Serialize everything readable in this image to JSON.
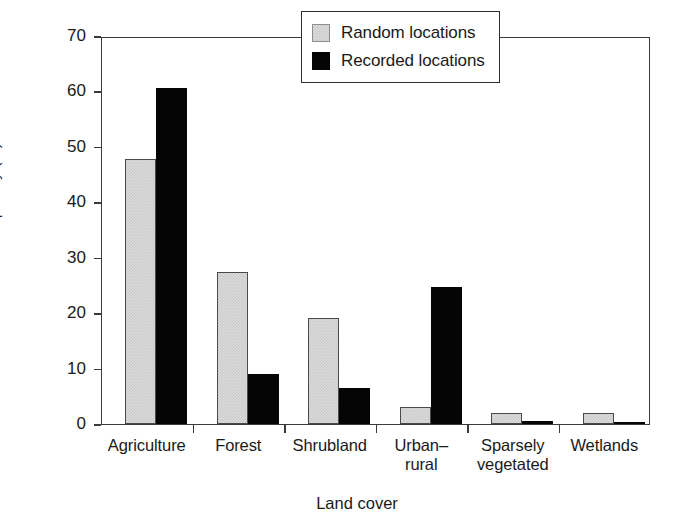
{
  "chart_data": {
    "type": "bar",
    "title": "",
    "xlabel": "Land cover",
    "ylabel": "Frequency (%)",
    "ylim": [
      0,
      70
    ],
    "yticks": [
      0,
      10,
      20,
      30,
      40,
      50,
      60,
      70
    ],
    "ytick_labels": [
      "0",
      "10",
      "20",
      "30",
      "40",
      "50",
      "60",
      "70"
    ],
    "grid": false,
    "legend_position": "top-right",
    "categories": [
      "Agriculture",
      "Forest",
      "Shrubland",
      "Urban–rural",
      "Sparsely vegetated",
      "Wetlands"
    ],
    "category_lines": [
      [
        "Agriculture"
      ],
      [
        "Forest"
      ],
      [
        "Shrubland"
      ],
      [
        "Urban–",
        "rural"
      ],
      [
        "Sparsely",
        "vegetated"
      ],
      [
        "Wetlands"
      ]
    ],
    "series": [
      {
        "name": "Random locations",
        "color": "#dcdcdc",
        "values": [
          47.8,
          27.4,
          19.1,
          3.0,
          2.0,
          1.9
        ]
      },
      {
        "name": "Recorded locations",
        "color": "#050505",
        "values": [
          60.7,
          9.1,
          6.5,
          24.8,
          0.6,
          0.4
        ]
      }
    ]
  },
  "legend": {
    "items": [
      {
        "label": "Random locations",
        "swatch": "light-gray-hatched"
      },
      {
        "label": "Recorded locations",
        "swatch": "solid-black"
      }
    ]
  },
  "axis": {
    "frame_color": "#3a3a3a"
  }
}
